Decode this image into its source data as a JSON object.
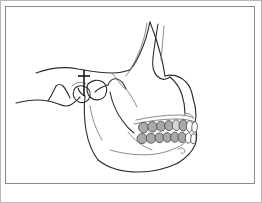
{
  "figure": {
    "title": "Lateral view line drawing of human skull, mandible and dentition",
    "type": "anatomical-line-drawing",
    "view": "lateral-right",
    "background_color": "#ffffff",
    "frame": {
      "outer_border_color": "#b8b8b8",
      "inner_border_color": "#8a8a8a",
      "inner_rect": {
        "x": 5,
        "y": 6,
        "width": 249,
        "height": 177
      },
      "outer_rect": {
        "x": 0,
        "y": 0,
        "width": 262,
        "height": 203
      },
      "line_width": 1
    },
    "stroke": {
      "outline_color": "#2b2b2b",
      "detail_color": "#6d6d6d",
      "outline_width": 1.1,
      "detail_width": 0.8
    }
  },
  "structures": [
    {
      "name": "cranial-base",
      "label": "Cranial base / temporal region"
    },
    {
      "name": "zygomatic-arch",
      "label": "Zygomatic arch"
    },
    {
      "name": "orbital-rim",
      "label": "Orbital rim"
    },
    {
      "name": "maxilla",
      "label": "Maxilla"
    },
    {
      "name": "mandible",
      "label": "Mandible"
    },
    {
      "name": "mandibular-ramus",
      "label": "Mandibular ramus"
    },
    {
      "name": "condyle",
      "label": "Mandibular condyle"
    },
    {
      "name": "coronoid-process",
      "label": "Coronoid process"
    },
    {
      "name": "mandibular-notch",
      "label": "Mandibular notch"
    },
    {
      "name": "mental-foramen",
      "label": "Mental foramen"
    },
    {
      "name": "external-auditory-meatus",
      "label": "External auditory meatus"
    },
    {
      "name": "mastoid-process",
      "label": "Mastoid process"
    }
  ],
  "marker": {
    "name": "tmj-indicator",
    "label": "TMJ / condyle indicator line",
    "color": "#1a1a1a",
    "line": {
      "x": 84,
      "y_top": 70,
      "y_bottom": 96
    },
    "crossbar": {
      "x_left": 78,
      "x_right": 90,
      "y": 76
    },
    "line_width": 1.6
  },
  "teeth": {
    "shaded_fill": "#a9a9a9",
    "light_fill": "#d4d4d4",
    "white_fill": "#ffffff",
    "stroke": "#4a4a4a",
    "upper_arch": [
      {
        "index": 1,
        "type": "molar",
        "fill": "shaded_fill",
        "cx": 143.5,
        "cy": 127.5,
        "rx": 5.0,
        "ry": 5.3,
        "rot": -8
      },
      {
        "index": 2,
        "type": "molar",
        "fill": "shaded_fill",
        "cx": 152.5,
        "cy": 126.8,
        "rx": 4.8,
        "ry": 5.2,
        "rot": -7
      },
      {
        "index": 3,
        "type": "premolar",
        "fill": "shaded_fill",
        "cx": 161.0,
        "cy": 126.2,
        "rx": 4.4,
        "ry": 5.0,
        "rot": -6
      },
      {
        "index": 4,
        "type": "premolar",
        "fill": "shaded_fill",
        "cx": 168.8,
        "cy": 125.6,
        "rx": 4.2,
        "ry": 5.0,
        "rot": -5
      },
      {
        "index": 5,
        "type": "canine",
        "fill": "light_fill",
        "cx": 176.2,
        "cy": 125.2,
        "rx": 4.0,
        "ry": 5.4,
        "rot": -4
      },
      {
        "index": 6,
        "type": "incisor",
        "fill": "shaded_fill",
        "cx": 183.2,
        "cy": 125.4,
        "rx": 4.2,
        "ry": 5.6,
        "rot": -2
      },
      {
        "index": 7,
        "type": "incisor",
        "fill": "white_fill",
        "cx": 189.6,
        "cy": 126.2,
        "rx": 3.2,
        "ry": 5.6,
        "rot": 2
      },
      {
        "index": 8,
        "type": "incisor",
        "fill": "white_fill",
        "cx": 194.6,
        "cy": 127.0,
        "rx": 2.8,
        "ry": 5.4,
        "rot": 4
      }
    ],
    "lower_arch": [
      {
        "index": 1,
        "type": "molar",
        "fill": "shaded_fill",
        "cx": 142.0,
        "cy": 138.6,
        "rx": 5.0,
        "ry": 5.0,
        "rot": -8
      },
      {
        "index": 2,
        "type": "molar",
        "fill": "shaded_fill",
        "cx": 151.0,
        "cy": 138.2,
        "rx": 4.8,
        "ry": 5.0,
        "rot": -7
      },
      {
        "index": 3,
        "type": "premolar",
        "fill": "shaded_fill",
        "cx": 159.4,
        "cy": 137.8,
        "rx": 4.4,
        "ry": 4.9,
        "rot": -6
      },
      {
        "index": 4,
        "type": "premolar",
        "fill": "shaded_fill",
        "cx": 167.2,
        "cy": 137.4,
        "rx": 4.2,
        "ry": 4.8,
        "rot": -5
      },
      {
        "index": 5,
        "type": "canine",
        "fill": "shaded_fill",
        "cx": 174.8,
        "cy": 137.2,
        "rx": 4.2,
        "ry": 5.0,
        "rot": -3
      },
      {
        "index": 6,
        "type": "incisor",
        "fill": "shaded_fill",
        "cx": 182.0,
        "cy": 137.4,
        "rx": 4.0,
        "ry": 5.2,
        "rot": -1
      },
      {
        "index": 7,
        "type": "incisor",
        "fill": "white_fill",
        "cx": 188.4,
        "cy": 138.0,
        "rx": 3.0,
        "ry": 5.2,
        "rot": 3
      },
      {
        "index": 8,
        "type": "incisor",
        "fill": "white_fill",
        "cx": 193.4,
        "cy": 138.8,
        "rx": 2.6,
        "ry": 5.0,
        "rot": 5
      }
    ]
  },
  "paths": {
    "cranial_outline": "M 36,73 C 50,68 64,66 78,69 C 90,71 100,73 112,73 C 118,73 124,72 130,70",
    "temporal_lower": "M 16,103 C 28,100 38,99 48,101 C 56,102 60,106 66,106 C 72,106 76,101 80,97",
    "mastoid": "M 48,101 C 52,95 54,90 56,86 C 58,84 61,84 63,86 C 66,89 68,94 70,98",
    "zygoma_upper": "M 130,70 C 136,63 142,50 146,38 C 148,31 149,26 150,22",
    "zygoma_inner": "M 126,76 C 132,68 138,56 142,44 C 145,36 146,29 147,23",
    "zygoma_body": "M 150,22 C 154,32 158,44 161,56 C 163,64 164,70 165,76",
    "orbit_rim": "M 158,24 C 156,36 154,48 153,58 C 152,66 153,72 157,76 C 161,80 166,80 170,77",
    "orbit_inner": "M 164,26 C 163,38 162,50 161,60",
    "maxilla_front": "M 165,76 C 172,74 180,76 186,82 C 190,86 192,92 193,98",
    "maxilla_face": "M 193,98 C 195,104 196,110 196,116 C 196,120 195,123 193,126",
    "nasal_spine": "M 170,77 C 176,82 180,88 182,95 C 184,101 185,108 185,114",
    "nasal_notch": "M 185,114 C 188,113 191,114 193,117",
    "alveolar_upper": "M 136,120 C 150,117 164,115 178,115 C 185,115 190,116 194,118",
    "alveolar_upper2": "M 134,124 C 148,121 162,119 176,119 C 184,119 190,120 195,122",
    "ramus_post": "M 85,96 C 84,106 84,118 86,130 C 88,142 92,152 98,160",
    "ramus_ant": "M 110,92 C 112,102 116,112 122,120 C 126,126 130,130 134,133",
    "condyle_neck": "M 78,88 C 79,92 81,94 85,96",
    "coronoid": "M 108,85 C 110,80 113,78 117,79 C 121,80 124,84 126,89",
    "mandibular_notch": "M 95,92 C 99,88 104,86 108,85",
    "body_lower": "M 98,160 C 108,168 122,172 138,172 C 152,172 166,169 178,163",
    "body_edge": "M 178,163 C 186,158 192,152 195,145 C 197,140 197,135 196,131",
    "body_inner": "M 110,150 C 124,154 140,156 156,154 C 168,152 178,148 186,142",
    "oblique_line": "M 128,132 C 134,140 142,146 152,150",
    "mental_foramen": "M 178,149 C 181,147 184,148 185,151 C 185,153 183,154 181,153",
    "ear_canal": "M 88,84 C 92,80 98,79 103,82 C 107,85 108,91 105,96 C 101,101 94,101 90,97 C 87,94 86,88 88,84",
    "glenoid_fossa": "M 72,86 C 76,82 82,81 86,84",
    "condyle_head": "M 74,90 C 72,95 74,100 79,102 C 84,104 89,101 90,96 C 91,91 88,87 83,86 C 79,85 75,87 74,90",
    "sigmoid_detail": "M 126,89 C 130,94 134,100 137,107",
    "upper_face_detail": "M 112,73 C 116,78 120,84 124,88",
    "post_ramus_detail": "M 90,106 C 92,118 96,130 102,140"
  }
}
